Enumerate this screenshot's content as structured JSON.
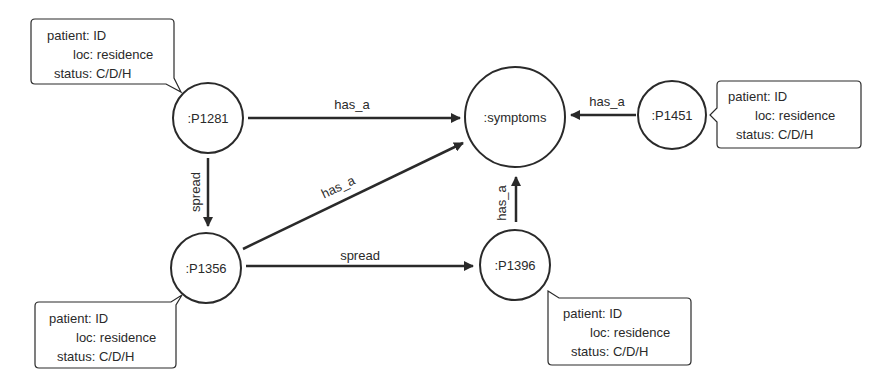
{
  "diagram": {
    "nodes": [
      {
        "id": "symptoms",
        "label": ":symptoms"
      },
      {
        "id": "p1281",
        "label": ":P1281"
      },
      {
        "id": "p1451",
        "label": ":P1451"
      },
      {
        "id": "p1356",
        "label": ":P1356"
      },
      {
        "id": "p1396",
        "label": ":P1396"
      }
    ],
    "edges": [
      {
        "from": "p1281",
        "to": "symptoms",
        "label": "has_a"
      },
      {
        "from": "p1451",
        "to": "symptoms",
        "label": "has_a"
      },
      {
        "from": "p1281",
        "to": "p1356",
        "label": "spread"
      },
      {
        "from": "p1356",
        "to": "symptoms",
        "label": "has_a"
      },
      {
        "from": "p1356",
        "to": "p1396",
        "label": "spread"
      },
      {
        "from": "p1396",
        "to": "symptoms",
        "label": "has_a"
      }
    ],
    "callouts": [
      {
        "node": "p1281",
        "lines": [
          "patient: ID",
          "loc: residence",
          "status: C/D/H"
        ]
      },
      {
        "node": "p1451",
        "lines": [
          "patient: ID",
          "loc: residence",
          "status: C/D/H"
        ]
      },
      {
        "node": "p1356",
        "lines": [
          "patient: ID",
          "loc: residence",
          "status: C/D/H"
        ]
      },
      {
        "node": "p1396",
        "lines": [
          "patient: ID",
          "loc: residence",
          "status: C/D/H"
        ]
      }
    ]
  },
  "colors": {
    "stroke": "#2a2a2a",
    "background": "#ffffff"
  }
}
